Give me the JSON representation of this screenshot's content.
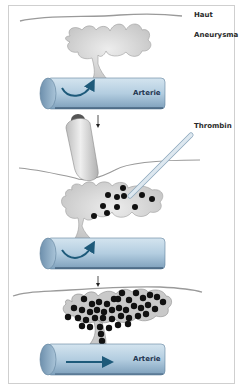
{
  "figure": {
    "labels": {
      "skin": "Haut",
      "aneurysm": "Aneurysma",
      "artery_top": "Arterie",
      "thrombin": "Thrombin",
      "artery_bottom": "Arterie"
    },
    "stages": [
      {
        "id": 1,
        "description": "Aneurysm connected to artery, turbulent flow into sac"
      },
      {
        "id": 2,
        "description": "Ultrasound probe compresses; thrombin injected via needle into aneurysm"
      },
      {
        "id": 3,
        "description": "Aneurysm thrombosed, laminar flow in artery"
      }
    ],
    "colors": {
      "artery_fill": "#b7cfe0",
      "artery_dark": "#6f93b0",
      "flow_arrow": "#1e5a7a",
      "aneurysm_fill": "#d6d6d6",
      "thrombus_dot": "#111111",
      "skin_line": "#9a9a9a",
      "frame": "#cfcfcf"
    }
  }
}
